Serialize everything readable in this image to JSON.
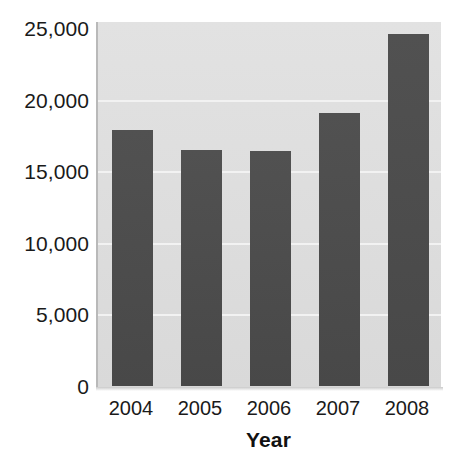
{
  "chart_data": {
    "type": "bar",
    "title": "",
    "xlabel": "Year",
    "ylabel": "",
    "categories": [
      "2004",
      "2005",
      "2006",
      "2007",
      "2008"
    ],
    "values": [
      17900,
      16500,
      16400,
      19100,
      24600
    ],
    "series": [
      {
        "name": "",
        "values": [
          17900,
          16500,
          16400,
          19100,
          24600
        ]
      }
    ],
    "ylim": [
      0,
      25000
    ],
    "yticks": [
      0,
      5000,
      10000,
      15000,
      20000,
      25000
    ],
    "ytick_labels": [
      "0",
      "5,000",
      "10,000",
      "15,000",
      "20,000",
      "25,000"
    ],
    "grid": true,
    "legend": false,
    "legend_position": "none",
    "colors": {
      "bar": "#4c4c4c",
      "plot_background": "#dddddd",
      "gridline": "#f2f2f2",
      "figure_background": "#ffffff",
      "text": "#1a1a1a"
    }
  },
  "axes": {
    "y": {
      "ticks": [
        {
          "label": "25,000",
          "value": 25000
        },
        {
          "label": "20,000",
          "value": 20000
        },
        {
          "label": "15,000",
          "value": 15000
        },
        {
          "label": "10,000",
          "value": 10000
        },
        {
          "label": "5,000",
          "value": 5000
        },
        {
          "label": "0",
          "value": 0
        }
      ]
    },
    "x": {
      "title": "Year",
      "ticks": [
        {
          "label": "2004"
        },
        {
          "label": "2005"
        },
        {
          "label": "2006"
        },
        {
          "label": "2007"
        },
        {
          "label": "2008"
        }
      ]
    }
  }
}
